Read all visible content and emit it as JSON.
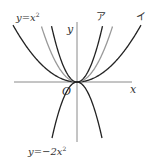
{
  "diagram": {
    "type": "parabola-graph",
    "axes": {
      "x_label": "x",
      "y_label": "y",
      "origin_label": "O"
    },
    "curves": [
      {
        "id": "y_eq_x2",
        "label": "y=x²",
        "color": "#999999",
        "coef_px": 0.044
      },
      {
        "id": "a",
        "label": "ア",
        "color": "#222222",
        "coef_px": 0.086
      },
      {
        "id": "i",
        "label": "イ",
        "color": "#222222",
        "coef_px": 0.0139
      },
      {
        "id": "y_eq_neg2x2",
        "label": "y=−2x²",
        "color": "#222222",
        "coef_px": -0.0896
      }
    ],
    "labels": {
      "y_eq_x2": "y=x",
      "y_eq_x2_exp": "2",
      "a": "ア",
      "i": "イ",
      "y_eq_neg2x2": "y=−2x",
      "y_eq_neg2x2_exp": "2"
    }
  }
}
